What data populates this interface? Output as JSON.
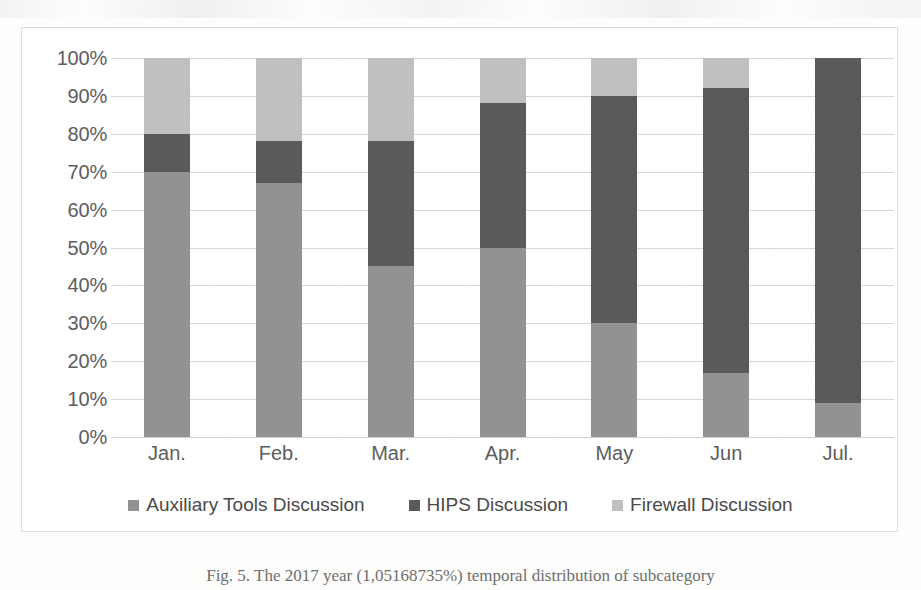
{
  "chart_data": {
    "type": "bar",
    "stacked": true,
    "stack_mode": "percent",
    "title": "",
    "xlabel": "",
    "ylabel": "",
    "ylim": [
      0,
      100
    ],
    "yticks": [
      "0%",
      "10%",
      "20%",
      "30%",
      "40%",
      "50%",
      "60%",
      "70%",
      "80%",
      "90%",
      "100%"
    ],
    "ytick_values": [
      0,
      10,
      20,
      30,
      40,
      50,
      60,
      70,
      80,
      90,
      100
    ],
    "grid": true,
    "legend_position": "bottom",
    "categories": [
      "Jan.",
      "Feb.",
      "Mar.",
      "Apr.",
      "May",
      "Jun",
      "Jul."
    ],
    "series": [
      {
        "name": "Auxiliary Tools Discussion",
        "color": "#929292",
        "values": [
          70,
          67,
          45,
          50,
          30,
          17,
          9
        ]
      },
      {
        "name": "HIPS Discussion",
        "color": "#5a5a5a",
        "values": [
          10,
          11,
          33,
          38,
          60,
          75,
          91
        ]
      },
      {
        "name": "Firewall Discussion",
        "color": "#c0c0c0",
        "values": [
          20,
          22,
          22,
          12,
          10,
          8,
          0
        ]
      }
    ]
  },
  "legend": {
    "items": [
      {
        "label": "Auxiliary Tools Discussion",
        "color": "#929292",
        "marker": "square-marker"
      },
      {
        "label": "HIPS Discussion",
        "color": "#5a5a5a",
        "marker": "square-marker"
      },
      {
        "label": "Firewall Discussion",
        "color": "#c0c0c0",
        "marker": "square-marker"
      }
    ]
  },
  "caption": {
    "text": "Fig. 5. The 2017 year (1,05168735%) temporal distribution of subcategory"
  },
  "colors": {
    "auxiliary_tools": "#929292",
    "hips": "#5a5a5a",
    "firewall": "#c0c0c0",
    "gridline": "#d8d8d4",
    "frame_border": "#dededa",
    "tick_text": "#5d5d5d",
    "background": "#ffffff"
  }
}
